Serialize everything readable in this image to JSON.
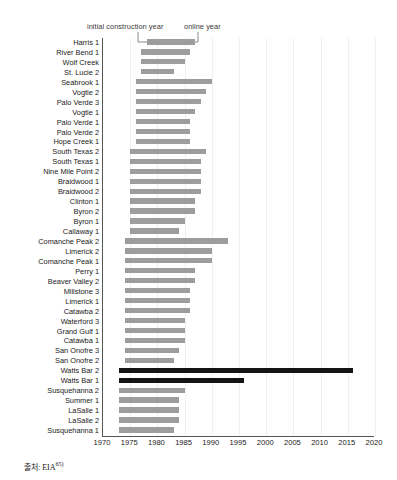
{
  "chart_data": {
    "type": "bar",
    "subtype": "horizontal-range-bar",
    "title": "",
    "xlabel": "",
    "ylabel": "",
    "xlim": [
      1970,
      2020
    ],
    "xticks": [
      1970,
      1975,
      1980,
      1985,
      1990,
      1995,
      2000,
      2005,
      2010,
      2015,
      2020
    ],
    "xtick_labels": [
      "1970",
      "1975",
      "1980",
      "1985",
      "1990",
      "1995",
      "2000",
      "2005",
      "2010",
      "2015",
      "2020"
    ],
    "grid": true,
    "legend_position": "top",
    "annotations": [
      {
        "text": "initial construction year",
        "points_to": "bar-start"
      },
      {
        "text": "online year",
        "points_to": "bar-end"
      }
    ],
    "series_names": [
      "initial construction year",
      "online year"
    ],
    "value_labels": [
      "start",
      "end"
    ],
    "categories": [
      "Harris 1",
      "River Bend 1",
      "Wolf Creek",
      "St. Lucie 2",
      "Seabrook 1",
      "Vogtle 2",
      "Palo Verde 3",
      "Vogtle 1",
      "Palo Verde 1",
      "Palo Verde 2",
      "Hope Creek 1",
      "South Texas 2",
      "South Texas 1",
      "Nine Mile Point 2",
      "Braidwood 1",
      "Braidwood 2",
      "Clinton 1",
      "Byron 2",
      "Byron 1",
      "Callaway 1",
      "Comanche Peak 2",
      "Limerick 2",
      "Comanche Peak 1",
      "Perry 1",
      "Beaver Valley 2",
      "Millstone 3",
      "Limerick 1",
      "Catawba 2",
      "Waterford 3",
      "Grand Gulf 1",
      "Catawba 1",
      "San Onofre 3",
      "San Onofre 2",
      "Watts Bar 2",
      "Watts Bar 1",
      "Susquehanna 2",
      "Summer 1",
      "LaSalle 1",
      "LaSalle 2",
      "Susquehanna 1"
    ],
    "bars": [
      {
        "name": "Harris 1",
        "start": 1978,
        "end": 1987,
        "highlight": false
      },
      {
        "name": "River Bend 1",
        "start": 1977,
        "end": 1986,
        "highlight": false
      },
      {
        "name": "Wolf Creek",
        "start": 1977,
        "end": 1985,
        "highlight": false
      },
      {
        "name": "St. Lucie 2",
        "start": 1977,
        "end": 1983,
        "highlight": false
      },
      {
        "name": "Seabrook 1",
        "start": 1976,
        "end": 1990,
        "highlight": false
      },
      {
        "name": "Vogtle 2",
        "start": 1976,
        "end": 1989,
        "highlight": false
      },
      {
        "name": "Palo Verde 3",
        "start": 1976,
        "end": 1988,
        "highlight": false
      },
      {
        "name": "Vogtle 1",
        "start": 1976,
        "end": 1987,
        "highlight": false
      },
      {
        "name": "Palo Verde 1",
        "start": 1976,
        "end": 1986,
        "highlight": false
      },
      {
        "name": "Palo Verde 2",
        "start": 1976,
        "end": 1986,
        "highlight": false
      },
      {
        "name": "Hope Creek 1",
        "start": 1976,
        "end": 1986,
        "highlight": false
      },
      {
        "name": "South Texas 2",
        "start": 1975,
        "end": 1989,
        "highlight": false
      },
      {
        "name": "South Texas 1",
        "start": 1975,
        "end": 1988,
        "highlight": false
      },
      {
        "name": "Nine Mile Point 2",
        "start": 1975,
        "end": 1988,
        "highlight": false
      },
      {
        "name": "Braidwood 1",
        "start": 1975,
        "end": 1988,
        "highlight": false
      },
      {
        "name": "Braidwood 2",
        "start": 1975,
        "end": 1988,
        "highlight": false
      },
      {
        "name": "Clinton 1",
        "start": 1975,
        "end": 1987,
        "highlight": false
      },
      {
        "name": "Byron 2",
        "start": 1975,
        "end": 1987,
        "highlight": false
      },
      {
        "name": "Byron 1",
        "start": 1975,
        "end": 1985,
        "highlight": false
      },
      {
        "name": "Callaway 1",
        "start": 1975,
        "end": 1984,
        "highlight": false
      },
      {
        "name": "Comanche Peak 2",
        "start": 1974,
        "end": 1993,
        "highlight": false
      },
      {
        "name": "Limerick 2",
        "start": 1974,
        "end": 1990,
        "highlight": false
      },
      {
        "name": "Comanche Peak 1",
        "start": 1974,
        "end": 1990,
        "highlight": false
      },
      {
        "name": "Perry 1",
        "start": 1974,
        "end": 1987,
        "highlight": false
      },
      {
        "name": "Beaver Valley 2",
        "start": 1974,
        "end": 1987,
        "highlight": false
      },
      {
        "name": "Millstone 3",
        "start": 1974,
        "end": 1986,
        "highlight": false
      },
      {
        "name": "Limerick 1",
        "start": 1974,
        "end": 1986,
        "highlight": false
      },
      {
        "name": "Catawba 2",
        "start": 1974,
        "end": 1986,
        "highlight": false
      },
      {
        "name": "Waterford 3",
        "start": 1974,
        "end": 1985,
        "highlight": false
      },
      {
        "name": "Grand Gulf 1",
        "start": 1974,
        "end": 1985,
        "highlight": false
      },
      {
        "name": "Catawba 1",
        "start": 1974,
        "end": 1985,
        "highlight": false
      },
      {
        "name": "San Onofre 3",
        "start": 1974,
        "end": 1984,
        "highlight": false
      },
      {
        "name": "San Onofre 2",
        "start": 1974,
        "end": 1983,
        "highlight": false
      },
      {
        "name": "Watts Bar 2",
        "start": 1973,
        "end": 2016,
        "highlight": true
      },
      {
        "name": "Watts Bar 1",
        "start": 1973,
        "end": 1996,
        "highlight": true
      },
      {
        "name": "Susquehanna 2",
        "start": 1973,
        "end": 1985,
        "highlight": false
      },
      {
        "name": "Summer 1",
        "start": 1973,
        "end": 1984,
        "highlight": false
      },
      {
        "name": "LaSalle 1",
        "start": 1973,
        "end": 1984,
        "highlight": false
      },
      {
        "name": "LaSalle 2",
        "start": 1973,
        "end": 1984,
        "highlight": false
      },
      {
        "name": "Susquehanna 1",
        "start": 1973,
        "end": 1983,
        "highlight": false
      }
    ]
  },
  "legend": {
    "construction_label": "initial construction year",
    "online_label": "online year"
  },
  "source": {
    "prefix": "출처: EIA",
    "footnote_marker": "65)"
  },
  "colors": {
    "bar": "#9d9d9d",
    "bar_highlight": "#141414",
    "grid": "#f0f0f0",
    "axis": "#555555",
    "text": "#1a1a1a"
  }
}
